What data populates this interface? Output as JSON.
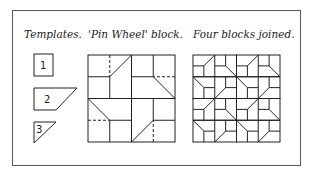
{
  "captions": {
    "templates": "Templates.",
    "pin_wheel": "'Pin Wheel' block.",
    "four_blocks": "Four blocks joined."
  },
  "templates": [
    {
      "label": "1",
      "shape": "square"
    },
    {
      "label": "2",
      "shape": "trapezoid"
    },
    {
      "label": "3",
      "shape": "triangle"
    }
  ],
  "colors": {
    "line": "#222222",
    "background": "#ffffff"
  }
}
